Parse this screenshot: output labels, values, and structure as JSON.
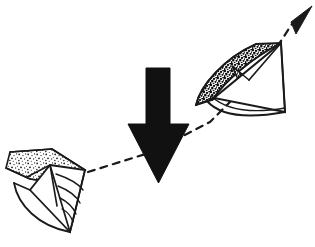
{
  "figure": {
    "background_color": "#ffffff",
    "ink_color": "#1a1a1a",
    "width": 315,
    "height": 247,
    "alt_text": "Line drawing: two stippled fan-shaped objects linked by a dashed diagonal trajectory with an arrowhead at the upper right, and a large solid black downward arrow in the centre."
  },
  "elements": {
    "start_object": {
      "name": "lower-left fan object",
      "label": "",
      "position": "lower-left",
      "texture": "light-stipple",
      "stipple_density": 0.38,
      "stipple_color": "#1a1a1a",
      "fill_color": "#ffffff"
    },
    "end_object": {
      "name": "upper-right fan object",
      "label": "",
      "position": "upper-right",
      "texture": "dark-stipple",
      "stipple_density": 0.72,
      "stipple_color": "#1a1a1a",
      "fill_color": "#ffffff"
    },
    "trajectory": {
      "name": "dashed motion path",
      "label": "",
      "style": "dashed",
      "dash_pattern": "7 6",
      "stroke_width": 2.2,
      "color": "#1a1a1a",
      "start_point": [
        88,
        172
      ],
      "end_point": [
        296,
        18
      ]
    },
    "trajectory_arrowhead": {
      "name": "path arrowhead",
      "label": "",
      "direction": "up-right",
      "color": "#1a1a1a"
    },
    "down_arrow": {
      "name": "large downward arrow",
      "label": "",
      "direction": "down",
      "color": "#111111",
      "shaft_left": 146,
      "shaft_right": 170,
      "shaft_top": 68,
      "head_left": 128,
      "head_right": 189,
      "head_top": 124,
      "tip_y": 183
    }
  }
}
